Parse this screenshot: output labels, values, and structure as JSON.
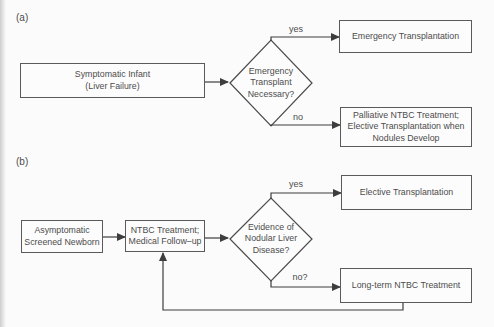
{
  "colors": {
    "background": "#fbfbfb",
    "line": "#3d3d3d",
    "box_border": "#5a5a5a",
    "text": "#4c4c4c"
  },
  "flowchart_a": {
    "label": "(a)",
    "start_box": "Symptomatic Infant\n(Liver Failure)",
    "decision": "Emergency\nTransplant\nNecessary?",
    "yes_label": "yes",
    "no_label": "no",
    "yes_outcome": "Emergency Transplantation",
    "no_outcome": "Palliative NTBC Treatment;\nElective Transplantation when\nNodules Develop"
  },
  "flowchart_b": {
    "label": "(b)",
    "start_box": "Asymptomatic\nScreened Newborn",
    "treatment_box": "NTBC Treatment;\nMedical Follow–up",
    "decision": "Evidence of\nNodular Liver\nDisease?",
    "yes_label": "yes",
    "no_label": "no?",
    "yes_outcome": "Elective Transplantation",
    "no_outcome": "Long-term NTBC Treatment"
  }
}
